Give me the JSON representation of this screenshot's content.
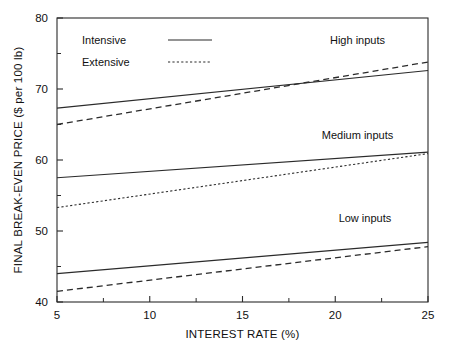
{
  "chart_data": {
    "type": "line",
    "title": "",
    "xlabel": "INTEREST RATE (%)",
    "ylabel": "FINAL BREAK-EVEN PRICE ($ per 100 lb)",
    "xlim": [
      5,
      25
    ],
    "ylim": [
      40,
      80
    ],
    "xticks": [
      5,
      10,
      15,
      20,
      25
    ],
    "xticklabels": [
      "5",
      "10",
      "15",
      "20",
      "25"
    ],
    "yticks": [
      40,
      50,
      60,
      70,
      80
    ],
    "yticklabels": [
      "40",
      "50",
      "60",
      "70",
      "80"
    ],
    "yminorticks": [
      45,
      55,
      65,
      75
    ],
    "xminorticks": [
      7.5,
      12.5,
      17.5,
      22.5
    ],
    "grid": false,
    "legend_position": "upper-left-inside",
    "legend": [
      {
        "label": "Intensive",
        "style": "solid"
      },
      {
        "label": "Extensive",
        "style": "dashed"
      }
    ],
    "annotations": [
      {
        "text": "High inputs",
        "x": 21.2,
        "y": 76.4
      },
      {
        "text": "Medium inputs",
        "x": 21.2,
        "y": 63.0
      },
      {
        "text": "Low inputs",
        "x": 21.6,
        "y": 51.2
      }
    ],
    "x": [
      5,
      25
    ],
    "series": [
      {
        "name": "High inputs - Intensive",
        "group": "High inputs",
        "style": "solid",
        "values": [
          67.3,
          72.6
        ]
      },
      {
        "name": "High inputs - Extensive",
        "group": "High inputs",
        "style": "dashed",
        "values": [
          65.0,
          73.8
        ]
      },
      {
        "name": "Medium inputs - Intensive",
        "group": "Medium inputs",
        "style": "solid",
        "values": [
          57.5,
          61.1
        ]
      },
      {
        "name": "Medium inputs - Extensive",
        "group": "Medium inputs",
        "style": "dotted",
        "values": [
          53.3,
          60.9
        ]
      },
      {
        "name": "Low inputs - Intensive",
        "group": "Low inputs",
        "style": "solid",
        "values": [
          44.0,
          48.4
        ]
      },
      {
        "name": "Low inputs - Extensive",
        "group": "Low inputs",
        "style": "dashed",
        "values": [
          41.5,
          47.8
        ]
      }
    ]
  },
  "colors": {
    "ink": "#2b2b2b",
    "background": "#ffffff"
  }
}
